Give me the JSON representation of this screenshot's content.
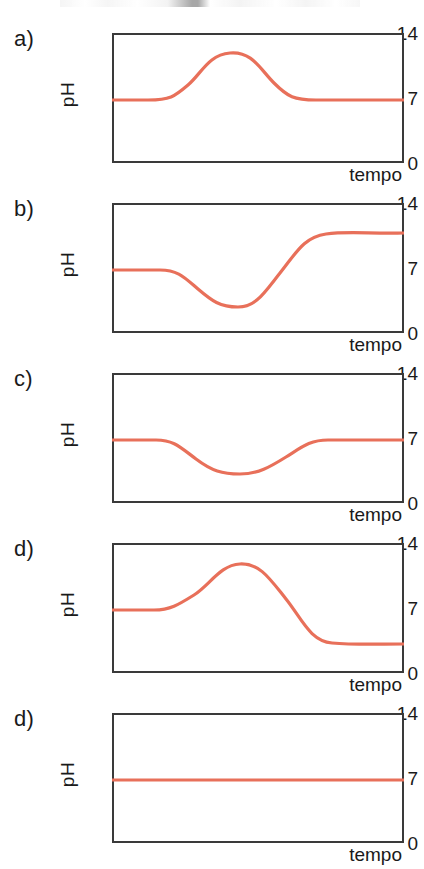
{
  "figure": {
    "line_color": "#e8705a",
    "frame_color": "#3a3a3a",
    "background": "#ffffff"
  },
  "axis": {
    "y_label": "pH",
    "x_label": "tempo",
    "y_ticks": [
      "14",
      "7",
      "0"
    ],
    "y_tick_top": "14",
    "y_tick_mid": "7",
    "y_tick_bottom": "0"
  },
  "panels": [
    {
      "letter": "a)",
      "y_label": "pH",
      "x_label": "tempo",
      "y_tick_top": "14",
      "y_tick_mid": "7",
      "y_tick_bottom": "0",
      "path": "M0,67 L36,67 C58,67 62,64 76,52 C90,40 96,22 118,20 C140,18 148,36 162,50 C176,64 182,67 204,67 L292,67"
    },
    {
      "letter": "b)",
      "y_label": "pH",
      "x_label": "tempo",
      "y_tick_top": "14",
      "y_tick_mid": "7",
      "y_tick_bottom": "0",
      "path": "M0,67 L48,67 C66,67 72,74 86,86 C100,98 108,104 126,104 C144,104 152,90 168,70 C184,50 192,34 214,31 C236,28 260,31 292,30"
    },
    {
      "letter": "c)",
      "y_label": "pH",
      "x_label": "tempo",
      "y_tick_top": "14",
      "y_tick_mid": "7",
      "y_tick_bottom": "0",
      "path": "M0,67 L44,67 C62,67 68,74 84,86 C100,98 110,101 128,101 C146,101 158,94 174,84 C190,74 198,67 216,67 L292,67"
    },
    {
      "letter": "d)",
      "y_label": "pH",
      "x_label": "tempo",
      "y_tick_top": "14",
      "y_tick_mid": "7",
      "y_tick_bottom": "0",
      "path": "M0,67 L42,67 C58,67 66,62 82,52 C98,42 108,22 128,21 C148,20 158,36 174,56 C190,76 198,98 220,100 C242,102 266,101 292,101"
    },
    {
      "letter": "d)",
      "y_label": "pH",
      "x_label": "tempo",
      "y_tick_top": "14",
      "y_tick_mid": "7",
      "y_tick_bottom": "0",
      "path": "M0,67 L292,67"
    }
  ],
  "chart_data": [
    {
      "type": "line",
      "title": "a)",
      "xlabel": "tempo",
      "ylabel": "pH",
      "ylim": [
        0,
        14
      ],
      "yticks": [
        0,
        7,
        14
      ],
      "grid": false,
      "legend": "none",
      "x": [
        0,
        0.12,
        0.25,
        0.33,
        0.4,
        0.5,
        0.58,
        0.65,
        0.72,
        0.85,
        1.0
      ],
      "y": [
        7.0,
        7.0,
        7.1,
        7.8,
        9.4,
        11.2,
        10.9,
        9.6,
        7.9,
        7.0,
        7.0
      ],
      "annotation": "pH starts neutral at 7, rises to a peak of about 11, then returns to 7"
    },
    {
      "type": "line",
      "title": "b)",
      "xlabel": "tempo",
      "ylabel": "pH",
      "ylim": [
        0,
        14
      ],
      "yticks": [
        0,
        7,
        14
      ],
      "grid": false,
      "legend": "none",
      "x": [
        0,
        0.15,
        0.25,
        0.33,
        0.43,
        0.5,
        0.58,
        0.66,
        0.75,
        0.88,
        1.0
      ],
      "y": [
        7.0,
        7.0,
        6.6,
        5.3,
        3.6,
        3.4,
        4.6,
        7.3,
        10.2,
        11.8,
        12.0
      ],
      "annotation": "pH starts at 7, dips to about 3.4, then rises and plateaus near 12"
    },
    {
      "type": "line",
      "title": "c)",
      "xlabel": "tempo",
      "ylabel": "pH",
      "ylim": [
        0,
        14
      ],
      "yticks": [
        0,
        7,
        14
      ],
      "grid": false,
      "legend": "none",
      "x": [
        0,
        0.14,
        0.25,
        0.33,
        0.42,
        0.5,
        0.58,
        0.66,
        0.75,
        0.85,
        1.0
      ],
      "y": [
        7.0,
        7.0,
        6.6,
        5.5,
        4.1,
        3.6,
        3.7,
        4.5,
        6.0,
        7.0,
        7.0
      ],
      "annotation": "pH starts at 7, dips to about 3.6, then returns to 7"
    },
    {
      "type": "line",
      "title": "d)",
      "xlabel": "tempo",
      "ylabel": "pH",
      "ylim": [
        0,
        14
      ],
      "yticks": [
        0,
        7,
        14
      ],
      "grid": false,
      "legend": "none",
      "x": [
        0,
        0.13,
        0.25,
        0.34,
        0.43,
        0.5,
        0.58,
        0.66,
        0.75,
        0.86,
        1.0
      ],
      "y": [
        7.0,
        7.0,
        7.5,
        9.0,
        10.9,
        11.5,
        10.5,
        8.0,
        5.2,
        3.7,
        3.6
      ],
      "annotation": "pH starts at 7, peaks near 11.5, then falls and plateaus near 3.6"
    },
    {
      "type": "line",
      "title": "d)",
      "xlabel": "tempo",
      "ylabel": "pH",
      "ylim": [
        0,
        14
      ],
      "yticks": [
        0,
        7,
        14
      ],
      "grid": false,
      "legend": "none",
      "x": [
        0,
        0.25,
        0.5,
        0.75,
        1.0
      ],
      "y": [
        7.0,
        7.0,
        7.0,
        7.0,
        7.0
      ],
      "annotation": "pH remains constant at 7 for the whole duration"
    }
  ]
}
